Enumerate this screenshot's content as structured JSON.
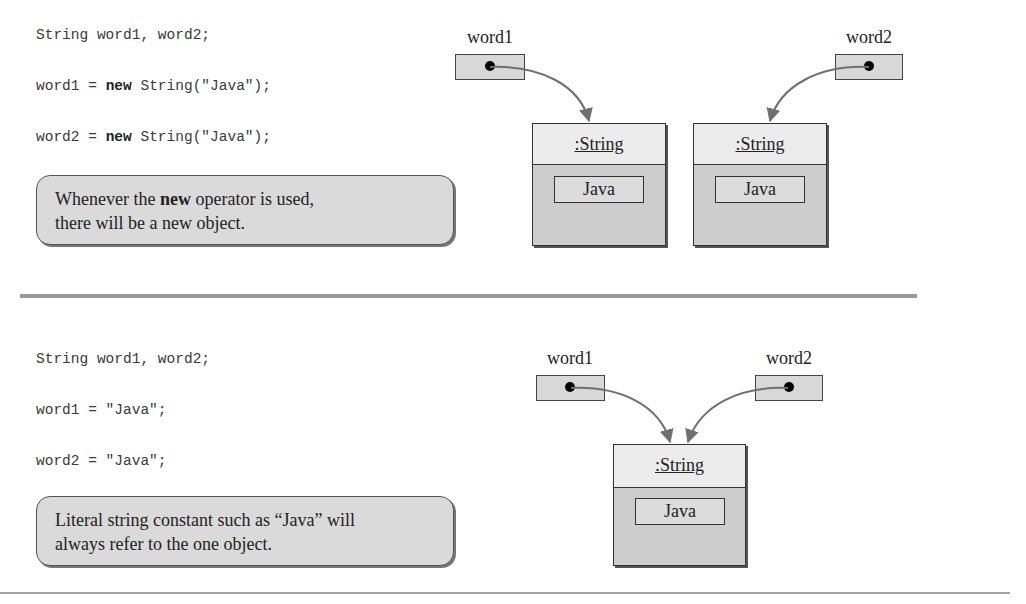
{
  "top_panel": {
    "code": {
      "line1": "String word1, word2;",
      "line2_pre": "word1 = ",
      "line2_kw": "new",
      "line2_post": " String(\"Java\");",
      "line3_pre": "word2 = ",
      "line3_kw": "new",
      "line3_post": " String(\"Java\");"
    },
    "note": {
      "pre": "Whenever the ",
      "bold": "new",
      "post": " operator is used,",
      "line2": "there will be a new object."
    },
    "variables": [
      {
        "label": "word1"
      },
      {
        "label": "word2"
      }
    ],
    "objects": [
      {
        "type": ":String",
        "value": "Java"
      },
      {
        "type": ":String",
        "value": "Java"
      }
    ]
  },
  "bottom_panel": {
    "code": {
      "line1": "String word1, word2;",
      "line2": "word1 = \"Java\";",
      "line3": "word2 = \"Java\";"
    },
    "note": {
      "line1": "Literal string constant such as “Java” will",
      "line2": "always refer to the one object."
    },
    "variables": [
      {
        "label": "word1"
      },
      {
        "label": "word2"
      }
    ],
    "objects": [
      {
        "type": ":String",
        "value": "Java"
      }
    ]
  },
  "colors": {
    "box_fill": "#cdcdcd",
    "header_fill": "#ececec",
    "arrow": "#707070",
    "separator": "#9a9a9a"
  }
}
